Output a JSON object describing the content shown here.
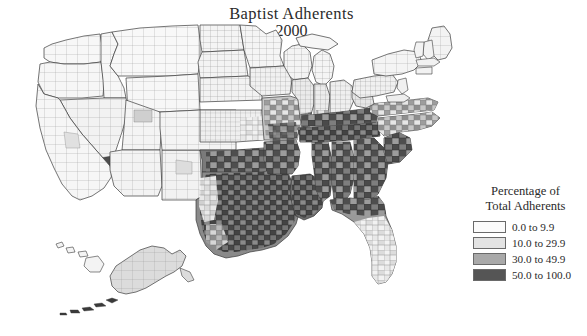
{
  "title": {
    "line1": "Baptist Adherents",
    "line2": "2000"
  },
  "legend": {
    "heading_line1": "Percentage of",
    "heading_line2": "Total Adherents",
    "items": [
      {
        "label": "0.0 to 9.9",
        "color": "#fbfbfb",
        "min": 0.0,
        "max": 9.9
      },
      {
        "label": "10.0 to 29.9",
        "color": "#e3e3e3",
        "min": 10.0,
        "max": 29.9
      },
      {
        "label": "30.0 to 49.9",
        "color": "#a9a9a9",
        "min": 30.0,
        "max": 49.9
      },
      {
        "label": "50.0 to 100.0",
        "color": "#555555",
        "min": 50.0,
        "max": 100.0
      }
    ]
  },
  "map": {
    "type": "choropleth",
    "geography": "united-states-counties",
    "year": "2000",
    "variable": "Baptist adherents as percentage of total adherents",
    "background_color": "#ffffff",
    "county_border_color": "#8f8f8f",
    "state_border_color": "#3a3a3a",
    "insets": [
      "alaska",
      "hawaii"
    ],
    "region_pattern": [
      {
        "region": "deep-south",
        "dominant_class": 3,
        "note": "Mississippi, Alabama, Georgia, Tennessee, Kentucky, Arkansas, Louisiana mostly 50.0 to 100.0"
      },
      {
        "region": "texas-oklahoma",
        "dominant_class": 3,
        "note": "central and eastern Texas and Oklahoma mostly 50.0 to 100.0"
      },
      {
        "region": "carolinas-virginia",
        "dominant_class": 2,
        "note": "mixed 30.0 to 49.9 and 50.0 to 100.0"
      },
      {
        "region": "florida",
        "dominant_class": 2,
        "note": "north Florida dark, south Florida lighter"
      },
      {
        "region": "midwest-great-lakes",
        "dominant_class": 0,
        "note": "mostly 0.0 to 9.9 with scattered 10.0 to 29.9"
      },
      {
        "region": "mountain-west",
        "dominant_class": 0,
        "note": "almost entirely 0.0 to 9.9"
      },
      {
        "region": "pacific-coast",
        "dominant_class": 0,
        "note": "almost entirely 0.0 to 9.9"
      },
      {
        "region": "northeast",
        "dominant_class": 0,
        "note": "almost entirely 0.0 to 9.9"
      },
      {
        "region": "alaska",
        "dominant_class": 1,
        "note": "light shading"
      },
      {
        "region": "hawaii",
        "dominant_class": 0,
        "note": "white to very light"
      }
    ]
  }
}
